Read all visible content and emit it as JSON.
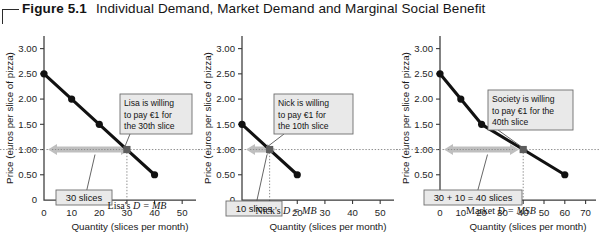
{
  "figure": {
    "number": "Figure 5.1",
    "title": "Individual Demand, Market Demand and Marginal Social Benefit"
  },
  "axes_common": {
    "ylabel": "Price (euros per slice of pizza)",
    "xlabel": "Quantity (slices per month)",
    "yticks": [
      "0",
      "0.50",
      "1.00",
      "1.50",
      "2.00",
      "2.50",
      "3.00"
    ],
    "reference_price": "1.00"
  },
  "chart_data": [
    {
      "type": "line",
      "id": "lisa",
      "title": "",
      "xlabel": "Quantity (slices per month)",
      "ylabel": "Price (euros per slice of pizza)",
      "xlim": [
        0,
        55
      ],
      "ylim": [
        0,
        3.25
      ],
      "xticks": [
        0,
        10,
        20,
        30,
        40,
        50
      ],
      "xticklabels": [
        "0",
        "10",
        "20",
        "30",
        "40",
        "50"
      ],
      "yticks": [
        0,
        0.5,
        1.0,
        1.5,
        2.0,
        2.5,
        3.0
      ],
      "yticklabels": [
        "0",
        "0.50",
        "1.00",
        "1.50",
        "2.00",
        "2.50",
        "3.00"
      ],
      "grid": false,
      "series": [
        {
          "name": "Lisa's D = MB",
          "x": [
            0,
            10,
            20,
            30,
            40
          ],
          "y": [
            2.5,
            2.0,
            1.5,
            1.0,
            0.5
          ]
        }
      ],
      "curve_label": "Lisa's D = MB",
      "highlight_point": {
        "x": 30,
        "y": 1.0
      },
      "callout": "Lisa is willing to pay €1 for the 30th slice",
      "callout_lines": [
        "Lisa is willing",
        "to pay €1 for",
        "the 30th slice"
      ],
      "span_label": "30 slices",
      "reference_line_y": 1.0
    },
    {
      "type": "line",
      "id": "nick",
      "title": "",
      "xlabel": "Quantity (slices per month)",
      "ylabel": "Price (euros per slice of pizza)",
      "xlim": [
        0,
        55
      ],
      "ylim": [
        0,
        3.25
      ],
      "xticks": [
        0,
        10,
        20,
        30,
        40,
        50
      ],
      "xticklabels": [
        "0",
        "10",
        "20",
        "30",
        "40",
        "50"
      ],
      "yticks": [
        0,
        0.5,
        1.0,
        1.5,
        2.0,
        2.5,
        3.0
      ],
      "yticklabels": [
        "0",
        "0.50",
        "1.00",
        "1.50",
        "2.00",
        "2.50",
        "3.00"
      ],
      "grid": false,
      "series": [
        {
          "name": "Nick's D = MB",
          "x": [
            0,
            10,
            20
          ],
          "y": [
            1.5,
            1.0,
            0.5
          ]
        }
      ],
      "curve_label": "Nick's D = MB",
      "highlight_point": {
        "x": 10,
        "y": 1.0
      },
      "callout": "Nick is willing to pay €1 for the 10th slice",
      "callout_lines": [
        "Nick is willing",
        "to pay €1 for",
        "the 10th slice"
      ],
      "span_label": "10 slices",
      "reference_line_y": 1.0
    },
    {
      "type": "line",
      "id": "market",
      "title": "",
      "xlabel": "Quantity (slices per month)",
      "ylabel": "Price (euros per slice of pizza)",
      "xlim": [
        0,
        75
      ],
      "ylim": [
        0,
        3.25
      ],
      "xticks": [
        0,
        10,
        20,
        30,
        40,
        50,
        60,
        70
      ],
      "xticklabels": [
        "0",
        "10",
        "20",
        "30",
        "40",
        "50",
        "60",
        "70"
      ],
      "yticks": [
        0,
        0.5,
        1.0,
        1.5,
        2.0,
        2.5,
        3.0
      ],
      "yticklabels": [
        "0",
        "0.50",
        "1.00",
        "1.50",
        "2.00",
        "2.50",
        "3.00"
      ],
      "grid": false,
      "series": [
        {
          "name": "Market D = MSB",
          "x": [
            0,
            10,
            20,
            40,
            60
          ],
          "y": [
            2.5,
            2.0,
            1.5,
            1.0,
            0.5
          ]
        }
      ],
      "curve_label": "Market D = MSB",
      "highlight_point": {
        "x": 40,
        "y": 1.0
      },
      "callout": "Society is willing to pay €1 for the 40th slice",
      "callout_lines": [
        "Society is willing",
        "to pay €1 for the",
        "40th slice"
      ],
      "span_label": "30 + 10 = 40 slices",
      "reference_line_y": 1.0
    }
  ],
  "colors": {
    "curve": "#111111",
    "arrow": "#bfbfbf",
    "callout_fill": "#e9e9e9",
    "callout_stroke": "#6d6d6d",
    "axis": "#3a3a3a"
  }
}
